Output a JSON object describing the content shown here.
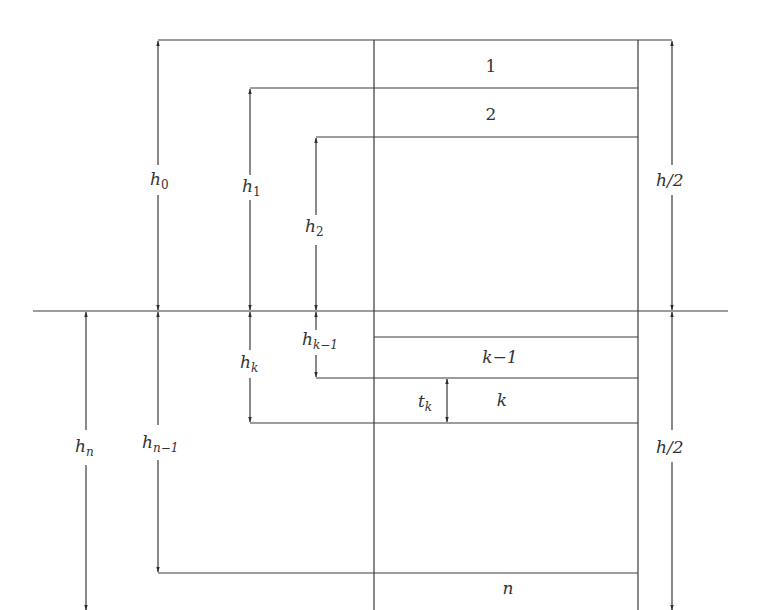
{
  "diagram": {
    "layers": [
      {
        "label": "1"
      },
      {
        "label": "2"
      },
      {
        "label": "k−1"
      },
      {
        "label": "k"
      },
      {
        "label": "n"
      }
    ],
    "dimensions": {
      "h0": {
        "base": "h",
        "sub": "0"
      },
      "h1": {
        "base": "h",
        "sub": "1"
      },
      "h2": {
        "base": "h",
        "sub": "2"
      },
      "hk_minus_1": {
        "base": "h",
        "sub": "k−1"
      },
      "hk": {
        "base": "h",
        "sub": "k"
      },
      "hn_minus_1": {
        "base": "h",
        "sub": "n−1"
      },
      "hn": {
        "base": "h",
        "sub": "n"
      },
      "tk": {
        "base": "t",
        "sub": "k"
      },
      "half_top": "h/2",
      "half_bottom": "h/2"
    },
    "line_color": "#3a3a3a"
  }
}
